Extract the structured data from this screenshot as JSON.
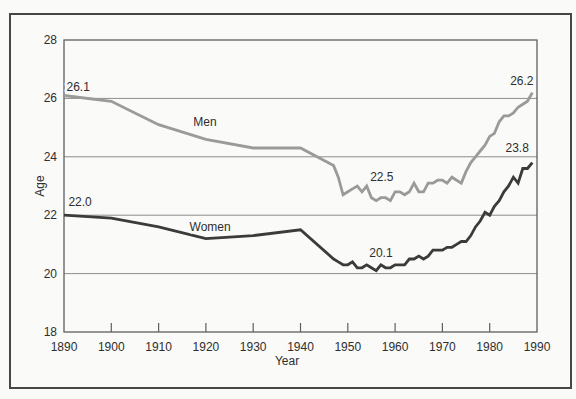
{
  "colors": {
    "background": "#fafaf8",
    "frame_border": "#474747",
    "plot_border": "#5f5f5f",
    "gridline": "#8c8c8c",
    "tick": "#5f5f5f",
    "text": "#2e2e2e",
    "men_line": "#9a9a9a",
    "women_line": "#3b3b3b"
  },
  "chart_data": {
    "type": "line",
    "title": "",
    "xlabel": "Year",
    "ylabel": "Age",
    "xlim": [
      1890,
      1990
    ],
    "ylim": [
      18,
      28
    ],
    "grid": "horizontal-only",
    "x_tick_labels": [
      "1890",
      "1900",
      "1910",
      "1920",
      "1930",
      "1940",
      "1950",
      "1960",
      "1970",
      "1980",
      "1990"
    ],
    "x_tick_years": [
      1890,
      1900,
      1910,
      1920,
      1930,
      1940,
      1950,
      1960,
      1970,
      1980,
      1990
    ],
    "y_tick_labels": [
      "18",
      "20",
      "22",
      "24",
      "26",
      "28"
    ],
    "y_tick_ages": [
      18,
      20,
      22,
      24,
      26,
      28
    ],
    "gridline_ages": [
      20,
      22,
      24,
      26
    ],
    "x": [
      1890,
      1900,
      1910,
      1920,
      1930,
      1940,
      1947,
      1948,
      1949,
      1950,
      1951,
      1952,
      1953,
      1954,
      1955,
      1956,
      1957,
      1958,
      1959,
      1960,
      1961,
      1962,
      1963,
      1964,
      1965,
      1966,
      1967,
      1968,
      1969,
      1970,
      1971,
      1972,
      1973,
      1974,
      1975,
      1976,
      1977,
      1978,
      1979,
      1980,
      1981,
      1982,
      1983,
      1984,
      1985,
      1986,
      1987,
      1988,
      1989
    ],
    "series": [
      {
        "name": "Men",
        "color_key": "men_line",
        "values": [
          26.1,
          25.9,
          25.1,
          24.6,
          24.3,
          24.3,
          23.7,
          23.3,
          22.7,
          22.8,
          22.9,
          23.0,
          22.8,
          23.0,
          22.6,
          22.5,
          22.6,
          22.6,
          22.5,
          22.8,
          22.8,
          22.7,
          22.8,
          23.1,
          22.8,
          22.8,
          23.1,
          23.1,
          23.2,
          23.2,
          23.1,
          23.3,
          23.2,
          23.1,
          23.5,
          23.8,
          24.0,
          24.2,
          24.4,
          24.7,
          24.8,
          25.2,
          25.4,
          25.4,
          25.5,
          25.7,
          25.8,
          25.9,
          26.2
        ]
      },
      {
        "name": "Women",
        "color_key": "women_line",
        "values": [
          22.0,
          21.9,
          21.6,
          21.2,
          21.3,
          21.5,
          20.5,
          20.4,
          20.3,
          20.3,
          20.4,
          20.2,
          20.2,
          20.3,
          20.2,
          20.1,
          20.3,
          20.2,
          20.2,
          20.3,
          20.3,
          20.3,
          20.5,
          20.5,
          20.6,
          20.5,
          20.6,
          20.8,
          20.8,
          20.8,
          20.9,
          20.9,
          21.0,
          21.1,
          21.1,
          21.3,
          21.6,
          21.8,
          22.1,
          22.0,
          22.3,
          22.5,
          22.8,
          23.0,
          23.3,
          23.1,
          23.6,
          23.6,
          23.8
        ]
      }
    ],
    "series_labels": [
      {
        "label": "Men",
        "name": "men-series-label",
        "year": 1919.8,
        "age": 25.2
      },
      {
        "label": "Women",
        "name": "women-series-label",
        "year": 1920.9,
        "age": 21.6
      }
    ],
    "annotations": [
      {
        "label": "26.1",
        "name": "men-start-value",
        "year": 1893.0,
        "age": 26.4
      },
      {
        "label": "22.0",
        "name": "women-start-value",
        "year": 1893.4,
        "age": 22.45
      },
      {
        "label": "22.5",
        "name": "men-min-value",
        "year": 1957.2,
        "age": 23.3
      },
      {
        "label": "20.1",
        "name": "women-min-value",
        "year": 1957.0,
        "age": 20.7
      },
      {
        "label": "26.2",
        "name": "men-end-value",
        "year": 1986.8,
        "age": 26.6
      },
      {
        "label": "23.8",
        "name": "women-end-value",
        "year": 1985.8,
        "age": 24.3
      }
    ],
    "legend": "inline-series-labels"
  }
}
